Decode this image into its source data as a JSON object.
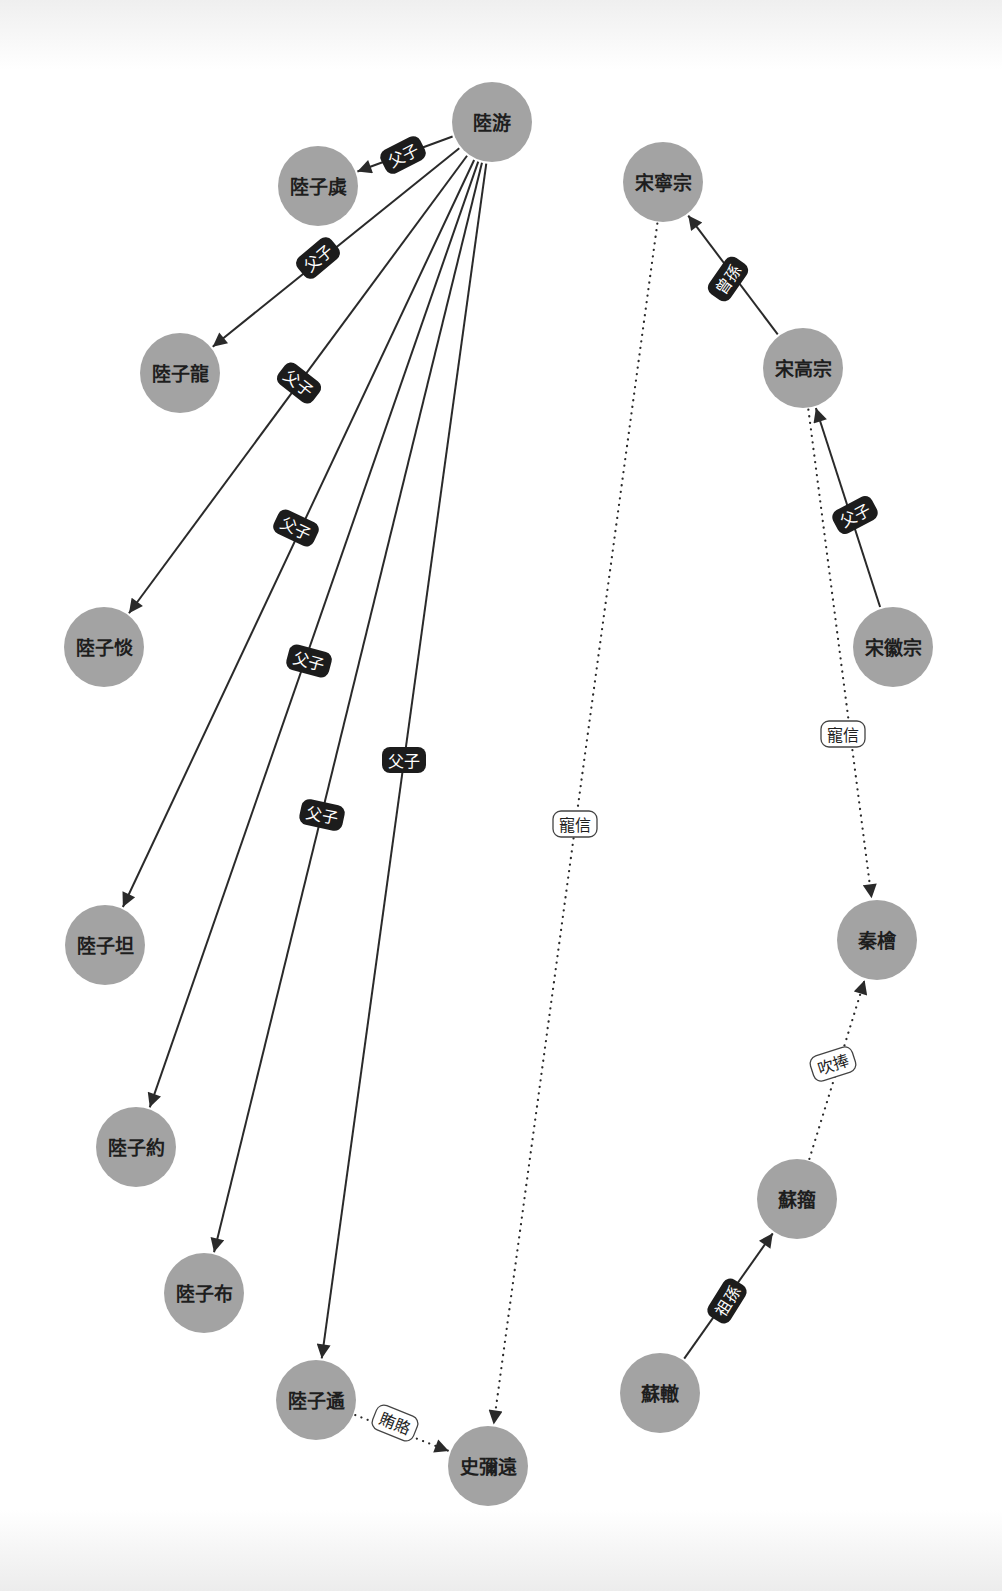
{
  "diagram": {
    "type": "relationship-graph",
    "style": {
      "node_fill": "#a3a3a3",
      "node_text": "#1e1e1e",
      "edge_color": "#2a2a2a",
      "solid_label_bg": "#1c1c1c",
      "dotted_label_bg": "#ffffff",
      "background": "#ffffff"
    },
    "nodes": [
      {
        "id": "luyou",
        "label": "陸游",
        "x": 492,
        "y": 122
      },
      {
        "id": "luziqu",
        "label": "陸子虡",
        "x": 318,
        "y": 186
      },
      {
        "id": "luzilong",
        "label": "陸子龍",
        "x": 180,
        "y": 373
      },
      {
        "id": "luzitan1",
        "label": "陸子惔",
        "x": 104,
        "y": 647
      },
      {
        "id": "luzitan2",
        "label": "陸子坦",
        "x": 105,
        "y": 945
      },
      {
        "id": "luziyue",
        "label": "陸子約",
        "x": 136,
        "y": 1147
      },
      {
        "id": "luzibu",
        "label": "陸子布",
        "x": 204,
        "y": 1293
      },
      {
        "id": "luziyu",
        "label": "陸子遹",
        "x": 316,
        "y": 1400
      },
      {
        "id": "shimiyuan",
        "label": "史彌遠",
        "x": 488,
        "y": 1466
      },
      {
        "id": "songningzong",
        "label": "宋寧宗",
        "x": 663,
        "y": 182
      },
      {
        "id": "songgaozong",
        "label": "宋高宗",
        "x": 803,
        "y": 368
      },
      {
        "id": "songhuizong",
        "label": "宋徽宗",
        "x": 893,
        "y": 647
      },
      {
        "id": "qinhui",
        "label": "秦檜",
        "x": 877,
        "y": 940
      },
      {
        "id": "suzhou",
        "label": "蘇籀",
        "x": 797,
        "y": 1199
      },
      {
        "id": "suzhe",
        "label": "蘇轍",
        "x": 660,
        "y": 1393
      }
    ],
    "edges": [
      {
        "from": "luyou",
        "to": "luziqu",
        "label": "父子",
        "style": "solid",
        "lx": 403,
        "ly": 155,
        "angle": -27
      },
      {
        "from": "luyou",
        "to": "luzilong",
        "label": "父子",
        "style": "solid",
        "lx": 318,
        "ly": 258,
        "angle": -40
      },
      {
        "from": "luyou",
        "to": "luzitan1",
        "label": "父子",
        "style": "solid",
        "lx": 299,
        "ly": 383,
        "angle": 38
      },
      {
        "from": "luyou",
        "to": "luzitan2",
        "label": "父子",
        "style": "solid",
        "lx": 296,
        "ly": 528,
        "angle": 25
      },
      {
        "from": "luyou",
        "to": "luziyue",
        "label": "父子",
        "style": "solid",
        "lx": 309,
        "ly": 661,
        "angle": 15
      },
      {
        "from": "luyou",
        "to": "luzibu",
        "label": "父子",
        "style": "solid",
        "lx": 322,
        "ly": 815,
        "angle": 12
      },
      {
        "from": "luyou",
        "to": "luziyu",
        "label": "父子",
        "style": "solid",
        "lx": 404,
        "ly": 760,
        "angle": 0
      },
      {
        "from": "songgaozong",
        "to": "songningzong",
        "label": "曾孫",
        "style": "solid",
        "lx": 728,
        "ly": 279,
        "angle": -55
      },
      {
        "from": "songhuizong",
        "to": "songgaozong",
        "label": "父子",
        "style": "solid",
        "lx": 855,
        "ly": 515,
        "angle": -28
      },
      {
        "from": "suzhe",
        "to": "suzhou",
        "label": "祖孫",
        "style": "solid",
        "lx": 727,
        "ly": 1301,
        "angle": -58
      },
      {
        "from": "songningzong",
        "to": "shimiyuan",
        "label": "寵信",
        "style": "dotted",
        "lx": 575,
        "ly": 824,
        "angle": 0
      },
      {
        "from": "songgaozong",
        "to": "qinhui",
        "label": "寵信",
        "style": "dotted",
        "lx": 843,
        "ly": 734,
        "angle": 0
      },
      {
        "from": "suzhou",
        "to": "qinhui",
        "label": "吹捧",
        "style": "dotted",
        "lx": 833,
        "ly": 1064,
        "angle": -18
      },
      {
        "from": "luziyu",
        "to": "shimiyuan",
        "label": "賄賂",
        "style": "dotted",
        "lx": 395,
        "ly": 1423,
        "angle": 22
      }
    ]
  }
}
